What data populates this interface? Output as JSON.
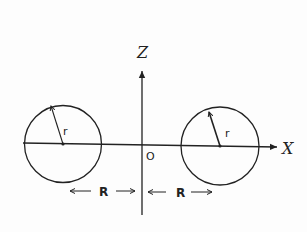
{
  "diagram": {
    "title": "",
    "axes": {
      "z_label": "Z",
      "x_label": "X",
      "origin_label": "O"
    },
    "circles": [
      {
        "name": "left-circle",
        "radius_label": "r"
      },
      {
        "name": "right-circle",
        "radius_label": "r"
      }
    ],
    "distances": [
      {
        "name": "left-distance",
        "label": "R"
      },
      {
        "name": "right-distance",
        "label": "R"
      }
    ],
    "colors": {
      "line": "#222222",
      "background": "#fdfdfd"
    }
  }
}
